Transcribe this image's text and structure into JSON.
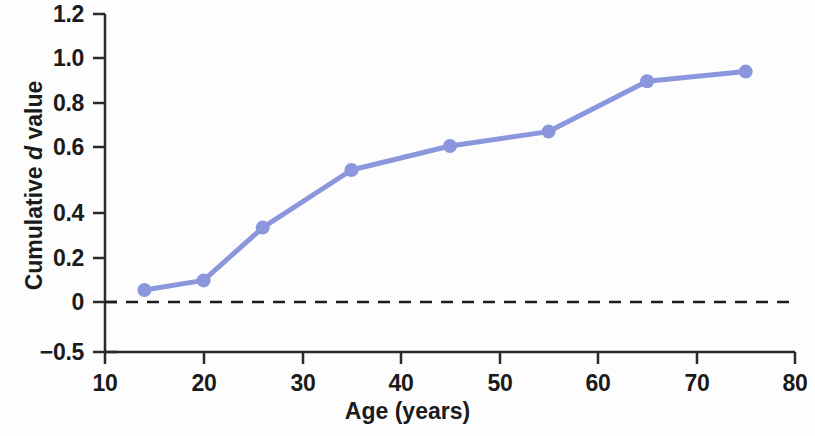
{
  "chart_data": {
    "type": "line",
    "title": "",
    "xlabel": "Age (years)",
    "ylabel": "Cumulative d value",
    "ylabel_parts": {
      "prefix": "Cumulative ",
      "italic": "d",
      "suffix": " value"
    },
    "x": [
      14,
      20,
      26,
      35,
      45,
      55,
      65,
      75
    ],
    "values": [
      0.05,
      0.09,
      0.31,
      0.55,
      0.65,
      0.71,
      0.92,
      0.96
    ],
    "series": [
      {
        "name": "Cumulative d value",
        "x": [
          14,
          20,
          26,
          35,
          45,
          55,
          65,
          75
        ],
        "values": [
          0.05,
          0.09,
          0.31,
          0.55,
          0.65,
          0.71,
          0.92,
          0.96
        ]
      }
    ],
    "xlim": [
      10,
      80
    ],
    "ylim": [
      -0.5,
      1.2
    ],
    "xticks": [
      10,
      20,
      30,
      40,
      50,
      60,
      70,
      80
    ],
    "xtick_labels": [
      "10",
      "20",
      "30",
      "40",
      "50",
      "60",
      "70",
      "80"
    ],
    "yticks": [
      -0.5,
      0,
      0.2,
      0.4,
      0.6,
      0.8,
      1.0,
      1.2
    ],
    "ytick_labels": [
      "−0.5",
      "0",
      "0.2",
      "0.4",
      "0.6",
      "0.8",
      "1.0",
      "1.2"
    ],
    "grid": false,
    "legend": "none",
    "reference_line": {
      "axis": "y",
      "value": 0,
      "style": "dashed",
      "color": "#1b1b1b"
    },
    "axis_break": {
      "between": [
        -0.5,
        0
      ],
      "note": "compressed segment below zero"
    },
    "colors": {
      "series": "#8b96dd",
      "marker": "#8b96dd",
      "axis": "#2a2a2a",
      "text": "#1b1b1b",
      "background": "#fdfdfd"
    },
    "marker": {
      "shape": "circle",
      "radius": 7
    },
    "line_width": 5
  }
}
